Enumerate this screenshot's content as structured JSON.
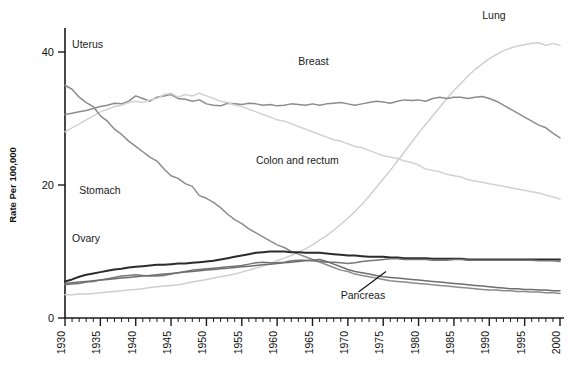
{
  "chart_data": {
    "type": "line",
    "title": "",
    "subtitle": "",
    "xlabel": "",
    "ylabel": "Rate Per 100,000",
    "xlim": [
      1930,
      2000
    ],
    "ylim": [
      0,
      46
    ],
    "grid": false,
    "legend_position": "inline-annotations",
    "y_ticks": [
      0,
      20,
      40
    ],
    "x_ticks": [
      1930,
      1935,
      1940,
      1945,
      1950,
      1955,
      1960,
      1965,
      1970,
      1975,
      1980,
      1985,
      1990,
      1995,
      2000
    ],
    "x_minor_tick_step": 1,
    "x": [
      1930,
      1931,
      1932,
      1933,
      1934,
      1935,
      1936,
      1937,
      1938,
      1939,
      1940,
      1941,
      1942,
      1943,
      1944,
      1945,
      1946,
      1947,
      1948,
      1949,
      1950,
      1951,
      1952,
      1953,
      1954,
      1955,
      1956,
      1957,
      1958,
      1959,
      1960,
      1961,
      1962,
      1963,
      1964,
      1965,
      1966,
      1967,
      1968,
      1969,
      1970,
      1971,
      1972,
      1973,
      1974,
      1975,
      1976,
      1977,
      1978,
      1979,
      1980,
      1981,
      1982,
      1983,
      1984,
      1985,
      1986,
      1987,
      1988,
      1989,
      1990,
      1991,
      1992,
      1993,
      1994,
      1995,
      1996,
      1997,
      1998,
      1999,
      2000
    ],
    "series": [
      {
        "name": "Lung",
        "color": "#cfcfcf",
        "label_x": 1993,
        "label_y": 45.2,
        "values": [
          3.5,
          3.5,
          3.6,
          3.6,
          3.7,
          3.8,
          3.9,
          4.0,
          4.1,
          4.2,
          4.3,
          4.4,
          4.6,
          4.7,
          4.8,
          4.9,
          5.0,
          5.2,
          5.4,
          5.6,
          5.8,
          6.0,
          6.2,
          6.4,
          6.6,
          6.9,
          7.2,
          7.5,
          7.8,
          8.2,
          8.6,
          9.0,
          9.4,
          9.9,
          10.4,
          11.0,
          11.7,
          12.4,
          13.2,
          14.1,
          15.0,
          16.0,
          17.1,
          18.3,
          19.6,
          20.9,
          22.2,
          23.6,
          25.0,
          26.4,
          27.8,
          29.1,
          30.4,
          31.7,
          33.0,
          34.2,
          35.3,
          36.4,
          37.4,
          38.2,
          39.0,
          39.6,
          40.2,
          40.6,
          40.9,
          41.1,
          41.3,
          41.4,
          41.0,
          41.3,
          41.0
        ]
      },
      {
        "name": "Breast",
        "color": "#8c8c8c",
        "label_x": 1964,
        "label_y": 38.5,
        "values": [
          30.6,
          30.8,
          31.0,
          31.2,
          31.5,
          31.8,
          32.0,
          32.3,
          32.2,
          32.6,
          33.4,
          33.0,
          32.6,
          33.2,
          33.4,
          33.6,
          33.0,
          32.9,
          32.6,
          32.8,
          32.2,
          32.0,
          31.9,
          32.3,
          32.2,
          32.1,
          32.3,
          32.2,
          32.0,
          32.1,
          31.9,
          32.0,
          32.2,
          32.1,
          32.0,
          32.2,
          32.0,
          32.2,
          32.3,
          32.4,
          32.2,
          32.0,
          32.2,
          32.4,
          32.6,
          32.5,
          32.3,
          32.6,
          32.8,
          32.7,
          32.8,
          32.6,
          33.0,
          33.2,
          33.0,
          33.2,
          33.2,
          33.0,
          33.2,
          33.3,
          33.0,
          32.6,
          32.0,
          31.4,
          30.8,
          30.2,
          29.6,
          29.0,
          28.6,
          27.8,
          27.1
        ]
      },
      {
        "name": "Colon and rectum",
        "color": "#d2d2d2",
        "label_x": 1962,
        "label_y": 23.6,
        "values": [
          28.0,
          28.6,
          29.2,
          29.8,
          30.4,
          31.0,
          31.4,
          31.8,
          32.0,
          32.4,
          32.6,
          32.4,
          32.8,
          33.0,
          33.6,
          33.8,
          33.2,
          33.6,
          33.4,
          33.8,
          33.4,
          33.0,
          32.6,
          32.4,
          32.0,
          31.8,
          31.4,
          31.0,
          30.6,
          30.2,
          29.8,
          29.6,
          29.2,
          28.8,
          28.4,
          28.0,
          27.6,
          27.2,
          26.8,
          26.6,
          26.2,
          25.8,
          25.6,
          25.2,
          24.8,
          24.4,
          24.2,
          24.0,
          23.6,
          23.4,
          23.0,
          22.4,
          22.2,
          22.0,
          21.6,
          21.4,
          21.2,
          20.8,
          20.6,
          20.4,
          20.2,
          20.0,
          19.8,
          19.6,
          19.4,
          19.2,
          19.0,
          18.8,
          18.5,
          18.2,
          17.9
        ]
      },
      {
        "name": "Stomach",
        "color": "#8c8c8c",
        "label_x": 1934,
        "label_y": 19.0,
        "values": [
          35.0,
          34.4,
          33.2,
          32.4,
          31.8,
          30.4,
          29.6,
          28.4,
          27.6,
          26.6,
          25.8,
          25.0,
          24.2,
          23.6,
          22.4,
          21.4,
          21.0,
          20.2,
          19.8,
          18.4,
          18.0,
          17.4,
          16.6,
          15.6,
          14.8,
          14.2,
          13.4,
          12.8,
          12.2,
          11.6,
          11.0,
          10.6,
          10.0,
          9.6,
          9.2,
          8.8,
          8.4,
          8.0,
          7.6,
          7.2,
          7.0,
          6.6,
          6.4,
          6.2,
          6.0,
          5.8,
          5.6,
          5.5,
          5.4,
          5.3,
          5.2,
          5.1,
          5.0,
          4.9,
          4.8,
          4.7,
          4.6,
          4.5,
          4.4,
          4.3,
          4.2,
          4.2,
          4.1,
          4.1,
          4.0,
          4.0,
          3.9,
          3.9,
          3.8,
          3.8,
          3.7
        ]
      },
      {
        "name": "Uterus",
        "color": "#2b2b2b",
        "label_x": 1931,
        "label_y": 41.0,
        "values": [
          5.5,
          5.8,
          6.2,
          6.5,
          6.7,
          6.9,
          7.1,
          7.3,
          7.4,
          7.6,
          7.7,
          7.8,
          7.9,
          8.0,
          8.0,
          8.1,
          8.2,
          8.2,
          8.3,
          8.4,
          8.5,
          8.6,
          8.8,
          9.0,
          9.2,
          9.4,
          9.6,
          9.8,
          9.9,
          10.0,
          10.0,
          10.0,
          9.9,
          9.9,
          9.8,
          9.8,
          9.8,
          9.7,
          9.6,
          9.5,
          9.4,
          9.4,
          9.3,
          9.2,
          9.2,
          9.2,
          9.1,
          9.1,
          9.0,
          9.0,
          9.0,
          9.0,
          8.9,
          8.9,
          8.9,
          8.9,
          8.9,
          8.8,
          8.8,
          8.8,
          8.8,
          8.8,
          8.8,
          8.8,
          8.8,
          8.8,
          8.8,
          8.8,
          8.8,
          8.8,
          8.8
        ]
      },
      {
        "name": "Ovary",
        "color": "#777777",
        "label_x": 1933,
        "label_y": 11.6,
        "values": [
          5.0,
          5.1,
          5.2,
          5.4,
          5.5,
          5.7,
          5.9,
          6.1,
          6.3,
          6.4,
          6.5,
          6.4,
          6.3,
          6.3,
          6.4,
          6.6,
          6.8,
          7.0,
          7.2,
          7.3,
          7.4,
          7.5,
          7.6,
          7.7,
          7.8,
          7.9,
          8.1,
          8.3,
          8.4,
          8.3,
          8.3,
          8.4,
          8.6,
          8.7,
          8.7,
          8.6,
          8.5,
          8.4,
          8.4,
          8.3,
          8.2,
          8.3,
          8.5,
          8.6,
          8.7,
          8.8,
          8.9,
          8.9,
          8.8,
          8.8,
          8.8,
          8.8,
          8.7,
          8.7,
          8.7,
          8.8,
          8.8,
          8.7,
          8.7,
          8.7,
          8.7,
          8.7,
          8.7,
          8.7,
          8.7,
          8.7,
          8.7,
          8.6,
          8.6,
          8.6,
          8.5
        ]
      },
      {
        "name": "Pancreas",
        "color": "#6e6e6e",
        "label_x": 1972,
        "label_y": 3.2,
        "values": [
          5.2,
          5.3,
          5.4,
          5.5,
          5.6,
          5.7,
          5.8,
          5.9,
          6.0,
          6.1,
          6.2,
          6.3,
          6.4,
          6.5,
          6.6,
          6.7,
          6.8,
          6.9,
          7.0,
          7.1,
          7.2,
          7.3,
          7.4,
          7.5,
          7.6,
          7.7,
          7.8,
          7.9,
          8.0,
          8.1,
          8.2,
          8.3,
          8.4,
          8.5,
          8.6,
          8.7,
          8.8,
          8.5,
          8.1,
          7.7,
          7.3,
          7.0,
          6.8,
          6.6,
          6.4,
          6.2,
          6.1,
          6.0,
          5.9,
          5.8,
          5.7,
          5.6,
          5.5,
          5.4,
          5.3,
          5.2,
          5.1,
          5.0,
          4.9,
          4.8,
          4.7,
          4.6,
          4.5,
          4.4,
          4.4,
          4.3,
          4.3,
          4.2,
          4.2,
          4.1,
          4.1
        ]
      }
    ],
    "annotations": [
      {
        "text": "Lung",
        "x": 1989,
        "y": 45.0
      },
      {
        "text": "Breast",
        "x": 1963,
        "y": 38.0
      },
      {
        "text": "Colon and rectum",
        "x": 1957,
        "y": 23.2
      },
      {
        "text": "Stomach",
        "x": 1932,
        "y": 18.6
      },
      {
        "text": "Uterus",
        "x": 1931,
        "y": 40.6
      },
      {
        "text": "Ovary",
        "x": 1931,
        "y": 11.4
      },
      {
        "text": "Pancreas",
        "x": 1969,
        "y": 2.9
      }
    ],
    "leader_line": {
      "from_x": 1975.4,
      "from_y": 7.0,
      "to_x": 1971.5,
      "to_y": 3.9
    }
  },
  "axis": {
    "y_title": "Rate Per 100,000",
    "y_tick_labels": [
      "0",
      "20",
      "40"
    ],
    "x_tick_labels": [
      "1930",
      "1935",
      "1940",
      "1945",
      "1950",
      "1955",
      "1960",
      "1965",
      "1970",
      "1975",
      "1980",
      "1985",
      "1990",
      "1995",
      "2000"
    ]
  }
}
